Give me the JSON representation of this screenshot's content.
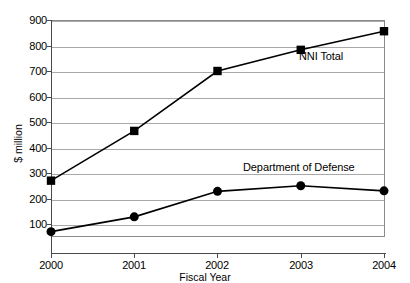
{
  "chart_data": {
    "type": "line",
    "title": "",
    "xlabel": "Fiscal Year",
    "ylabel": "$ million",
    "categories": [
      "2000",
      "2001",
      "2002",
      "2003",
      "2004"
    ],
    "x": [
      2000,
      2001,
      2002,
      2003,
      2004
    ],
    "xlim": [
      2000,
      2004
    ],
    "ylim": [
      50,
      900
    ],
    "yticks": [
      100,
      200,
      300,
      400,
      500,
      600,
      700,
      800,
      900
    ],
    "ytick_labels": [
      "100",
      "200",
      "300",
      "400",
      "500",
      "600",
      "700",
      "800",
      "900"
    ],
    "grid": "horizontal",
    "legend_position": "inline-annotations",
    "series": [
      {
        "name": "NNI Total",
        "marker": "square",
        "color": "#000000",
        "values": [
          270,
          465,
          700,
          783,
          856
        ]
      },
      {
        "name": "Department of Defense",
        "marker": "circle",
        "color": "#000000",
        "values": [
          70,
          128,
          228,
          250,
          230
        ]
      }
    ],
    "annotations": [
      {
        "text": "NNI Total",
        "series": "NNI Total"
      },
      {
        "text": "Department of Defense",
        "series": "Department of Defense"
      }
    ]
  }
}
